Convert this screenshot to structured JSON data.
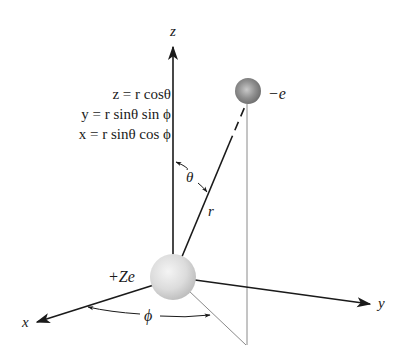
{
  "diagram": {
    "type": "spherical-coordinates-atom",
    "axes": {
      "x_label": "x",
      "y_label": "y",
      "z_label": "z"
    },
    "particles": {
      "nucleus_label": "+Ze",
      "electron_label": "−e"
    },
    "vectors": {
      "radius_label": "r"
    },
    "angles": {
      "polar_label": "θ",
      "azimuthal_label": "ϕ"
    },
    "equations": [
      "z = r cosθ",
      "y = r sinθ sin ϕ",
      "x = r sinθ cos ϕ"
    ],
    "colors": {
      "ink": "#1a1a1a",
      "projection_line": "#8a8a8a",
      "nucleus_fill": "#dcdcdc",
      "electron_fill": "#8f8f8f",
      "background": "#ffffff"
    }
  }
}
